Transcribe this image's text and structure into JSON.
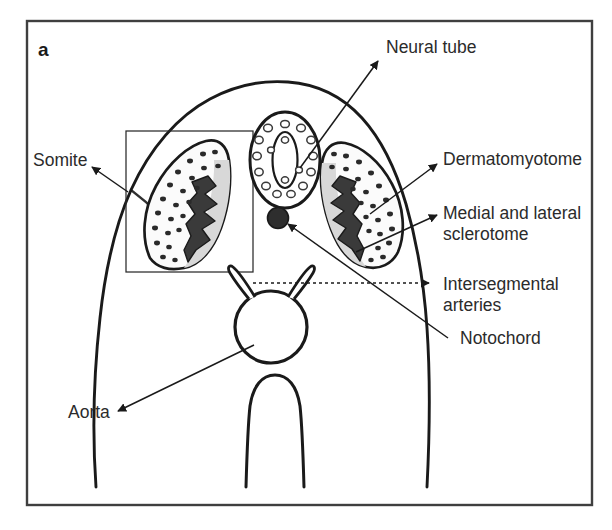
{
  "figure": {
    "panel_letter": "a",
    "type": "anatomical-diagram",
    "border_color": "#3a3a3a",
    "background_color": "#ffffff",
    "ink_color": "#1a1a1a"
  },
  "labels": {
    "neural_tube": "Neural tube",
    "somite": "Somite",
    "dermatomyotome": "Dermatomyotome",
    "sclerotome_line1": "Medial and lateral",
    "sclerotome_line2": "sclerotome",
    "intersegmental_line1": "Intersegmental",
    "intersegmental_line2": "arteries",
    "notochord": "Notochord",
    "aorta": "Aorta"
  },
  "structures": [
    {
      "name": "neural-tube",
      "description": "Oval epithelial tube with central lumen surrounded by nuclei"
    },
    {
      "name": "notochord",
      "description": "Small solid dark circle ventral to neural tube"
    },
    {
      "name": "somite-left",
      "description": "Elongated somite with dotted dermatomyotome and shaded sclerotome"
    },
    {
      "name": "somite-right",
      "description": "Mirror-image somite on the right side"
    },
    {
      "name": "dorsal-aorta",
      "description": "Circular vessel in the midline below the notochord"
    },
    {
      "name": "intersegmental-arteries",
      "description": "Paired vessels branching dorsally from the aorta"
    },
    {
      "name": "gut-tube",
      "description": "Ventral endodermal tube at the base of the section"
    },
    {
      "name": "body-wall",
      "description": "Outer ectodermal boundary of the embryo cross-section"
    },
    {
      "name": "inset-box",
      "description": "Thin rectangle framing the left somite"
    }
  ]
}
